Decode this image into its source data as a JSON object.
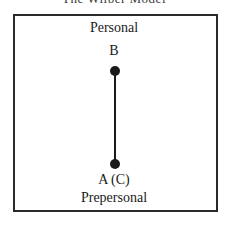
{
  "header": {
    "clipped_title": "The Wilber Model"
  },
  "diagram": {
    "top_label": "Personal",
    "point_b": "B",
    "point_a": "A (C)",
    "bottom_label": "Prepersonal",
    "colors": {
      "line": "#1a1a1a",
      "frame": "#2a2a2a"
    }
  }
}
